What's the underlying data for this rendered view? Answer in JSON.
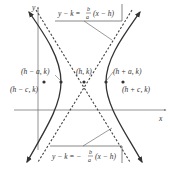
{
  "diagram": {
    "axes": {
      "x_label": "x",
      "y_label": "y"
    },
    "points": {
      "center": "(h, k)",
      "left_vertex": "(h − a, k)",
      "right_vertex": "(h + a, k)",
      "left_focus": "(h − c, k)",
      "right_focus": "(h + c, k)"
    },
    "asymptotes": {
      "upper": {
        "lhs": "y − k =",
        "num": "b",
        "den": "a",
        "rhs": "(x − h)"
      },
      "lower": {
        "lhs": "y − k = −",
        "num": "b",
        "den": "a",
        "rhs": "(x − h)"
      }
    },
    "colors": {
      "curve": "#333333",
      "asymptote": "#444444",
      "axis": "#666666",
      "text": "#333333"
    }
  }
}
